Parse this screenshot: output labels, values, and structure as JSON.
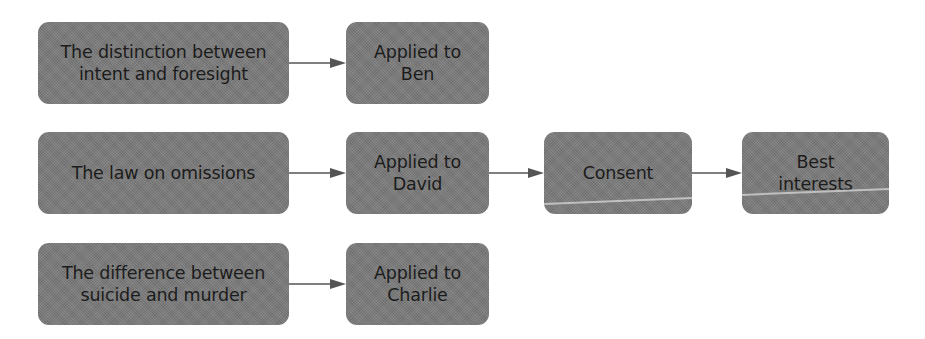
{
  "diagram": {
    "type": "flowchart",
    "direction": "left-to-right",
    "colors": {
      "node_fill": "#7b7b7b",
      "node_text": "#1c1c1c",
      "connector": "#555555",
      "background": "#ffffff"
    },
    "rows": [
      {
        "nodes": [
          {
            "id": "intent-foresight",
            "label": "The distinction between\nintent and foresight"
          },
          {
            "id": "applied-ben",
            "label": "Applied to\nBen"
          }
        ]
      },
      {
        "nodes": [
          {
            "id": "law-omissions",
            "label": "The law on omissions"
          },
          {
            "id": "applied-david",
            "label": "Applied to\nDavid"
          },
          {
            "id": "consent",
            "label": "Consent"
          },
          {
            "id": "best-interests",
            "label": "Best\ninterests"
          }
        ]
      },
      {
        "nodes": [
          {
            "id": "suicide-murder",
            "label": "The difference between\nsuicide and murder"
          },
          {
            "id": "applied-charlie",
            "label": "Applied to\nCharlie"
          }
        ]
      }
    ],
    "edges": [
      {
        "from": "intent-foresight",
        "to": "applied-ben"
      },
      {
        "from": "law-omissions",
        "to": "applied-david"
      },
      {
        "from": "applied-david",
        "to": "consent"
      },
      {
        "from": "consent",
        "to": "best-interests"
      },
      {
        "from": "suicide-murder",
        "to": "applied-charlie"
      }
    ]
  }
}
